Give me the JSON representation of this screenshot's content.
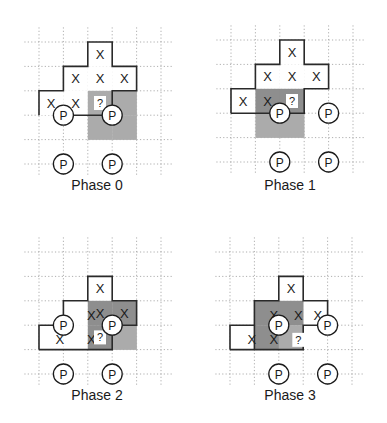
{
  "figure": {
    "width": 387,
    "height": 423,
    "colors": {
      "grid": "#9a9a9a",
      "outline": "#2a2a2a",
      "dark_shade": "#8e8e8e",
      "light_shade": "#ababab",
      "text": "#1a1a1a"
    },
    "symbols": {
      "x": "X",
      "question": "?",
      "p": "P"
    }
  },
  "panels": [
    {
      "label": "Phase 0",
      "origin": [
        39,
        42
      ],
      "step": 24.4,
      "grid_extent": {
        "cols": [
          -0.6,
          5.5
        ],
        "rows": [
          -0.6,
          5.5
        ]
      },
      "label_pos": [
        97,
        190
      ],
      "shaded": [
        {
          "col": 2,
          "row": 2,
          "shade": "light"
        },
        {
          "col": 3,
          "row": 2,
          "shade": "light"
        },
        {
          "col": 2,
          "row": 3,
          "shade": "light"
        },
        {
          "col": 3,
          "row": 3,
          "shade": "light"
        }
      ],
      "white_cells": [
        {
          "col": 2,
          "row": 0
        },
        {
          "col": 1,
          "row": 1
        },
        {
          "col": 2,
          "row": 1
        },
        {
          "col": 3,
          "row": 1
        },
        {
          "col": 0,
          "row": 2
        },
        {
          "col": 1,
          "row": 2
        }
      ],
      "x_marks": [
        {
          "col": 2,
          "row": 0
        },
        {
          "col": 1,
          "row": 1
        },
        {
          "col": 2,
          "row": 1
        },
        {
          "col": 3,
          "row": 1
        },
        {
          "col": 0,
          "row": 2
        },
        {
          "col": 1,
          "row": 2
        }
      ],
      "question": {
        "col": 2,
        "row": 2
      },
      "outline": "M0,3 L0,2 L1,2 L1,1 L2,1 L2,0 L3,0 L3,1 L4,1 L4,2 L3,2 L3,3",
      "outline_extra": "M1,3 L3,3",
      "p_marks": [
        {
          "x": 1,
          "y": 3
        },
        {
          "x": 3,
          "y": 3
        },
        {
          "x": 1,
          "y": 5
        },
        {
          "x": 3,
          "y": 5
        }
      ]
    },
    {
      "label": "Phase 1",
      "origin": [
        231,
        40
      ],
      "step": 24.4,
      "grid_extent": {
        "cols": [
          -0.6,
          5.5
        ],
        "rows": [
          -0.6,
          5.5
        ]
      },
      "label_pos": [
        290,
        190
      ],
      "shaded": [
        {
          "col": 1,
          "row": 2,
          "shade": "dark"
        },
        {
          "col": 2,
          "row": 2,
          "shade": "dark"
        },
        {
          "col": 1,
          "row": 3,
          "shade": "light"
        },
        {
          "col": 2,
          "row": 3,
          "shade": "light"
        }
      ],
      "white_cells": [
        {
          "col": 2,
          "row": 0
        },
        {
          "col": 1,
          "row": 1
        },
        {
          "col": 2,
          "row": 1
        },
        {
          "col": 3,
          "row": 1
        },
        {
          "col": 0,
          "row": 2
        }
      ],
      "x_marks": [
        {
          "col": 2,
          "row": 0
        },
        {
          "col": 1,
          "row": 1
        },
        {
          "col": 2,
          "row": 1
        },
        {
          "col": 3,
          "row": 1
        },
        {
          "col": 0,
          "row": 2
        },
        {
          "col": 1,
          "row": 2
        }
      ],
      "question": {
        "col": 2,
        "row": 2
      },
      "outline": "M0,3 L0,2 L1,2 L1,1 L2,1 L2,0 L3,0 L3,1 L4,1 L4,2 L3,2 L3,3 L0,3",
      "outline_extra": "",
      "p_marks": [
        {
          "x": 2,
          "y": 3
        },
        {
          "x": 4,
          "y": 3
        },
        {
          "x": 2,
          "y": 5
        },
        {
          "x": 4,
          "y": 5
        }
      ]
    },
    {
      "label": "Phase 2",
      "origin": [
        39,
        252
      ],
      "step": 24.4,
      "grid_extent": {
        "cols": [
          -0.6,
          5.5
        ],
        "rows": [
          -0.6,
          5.5
        ]
      },
      "label_pos": [
        97,
        400
      ],
      "shaded": [
        {
          "col": 2,
          "row": 2,
          "shade": "dark"
        },
        {
          "col": 3,
          "row": 2,
          "shade": "dark"
        },
        {
          "col": 2,
          "row": 3,
          "shade": "dark"
        },
        {
          "col": 3,
          "row": 3,
          "shade": "light"
        }
      ],
      "white_cells": [
        {
          "col": 2,
          "row": 1
        },
        {
          "col": 1,
          "row": 2
        },
        {
          "col": 0,
          "row": 3
        },
        {
          "col": 1,
          "row": 3
        }
      ],
      "x_marks": [
        {
          "col": 2,
          "row": 1
        },
        {
          "col": 1.65,
          "row": 2.1
        },
        {
          "col": 2,
          "row": 2
        },
        {
          "col": 3,
          "row": 2
        },
        {
          "col": 0.35,
          "row": 3.1
        },
        {
          "col": 1.65,
          "row": 3.1
        }
      ],
      "question": {
        "col": 2,
        "row": 3
      },
      "outline": "M0,4 L0,3 L1,3 L1,2 L2,2 L2,1 L3,1 L3,2 L4,2 L4,3 L3,3",
      "outline_extra": "M0,4 L3,4 L3,3",
      "p_marks": [
        {
          "x": 1,
          "y": 3
        },
        {
          "x": 3,
          "y": 3
        },
        {
          "x": 1,
          "y": 5
        },
        {
          "x": 3,
          "y": 5
        }
      ]
    },
    {
      "label": "Phase 3",
      "origin": [
        230,
        252
      ],
      "step": 24.4,
      "grid_extent": {
        "cols": [
          -0.6,
          5.5
        ],
        "rows": [
          -0.6,
          5.5
        ]
      },
      "label_pos": [
        290,
        400
      ],
      "shaded": [
        {
          "col": 1,
          "row": 2,
          "shade": "dark"
        },
        {
          "col": 2,
          "row": 2,
          "shade": "dark"
        },
        {
          "col": 1,
          "row": 3,
          "shade": "dark"
        },
        {
          "col": 2,
          "row": 3,
          "shade": "light"
        }
      ],
      "white_cells": [
        {
          "col": 2,
          "row": 1
        },
        {
          "col": 3,
          "row": 2
        },
        {
          "col": 0,
          "row": 3
        }
      ],
      "x_marks": [
        {
          "col": 2,
          "row": 1
        },
        {
          "col": 1.3,
          "row": 2.1
        },
        {
          "col": 2.3,
          "row": 2.1
        },
        {
          "col": 3.1,
          "row": 2.1
        },
        {
          "col": 0.4,
          "row": 3.1
        },
        {
          "col": 1.3,
          "row": 3.1
        }
      ],
      "question": {
        "col": 2.3,
        "row": 3.1
      },
      "outline": "M0,4 L0,3 L1,3 L1,2 L2,2 L2,1 L3,1 L3,2 L4,2 L4,3 L3,3 L3,4 L0,4",
      "outline_extra": "M1,3 L1,4",
      "p_marks": [
        {
          "x": 2,
          "y": 3
        },
        {
          "x": 4,
          "y": 3
        },
        {
          "x": 2,
          "y": 5
        },
        {
          "x": 4,
          "y": 5
        }
      ]
    }
  ]
}
